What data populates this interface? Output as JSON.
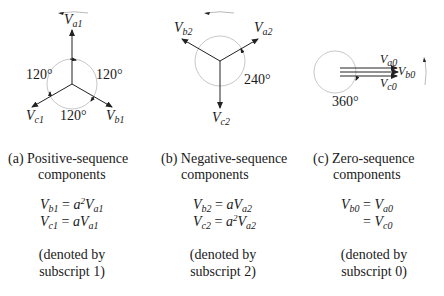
{
  "panels": [
    {
      "id": "a",
      "caption_line1": "(a) Positive-sequence",
      "caption_line2": "components",
      "phasors": [
        {
          "name": "V",
          "sub": "a1",
          "angle_deg": 90
        },
        {
          "name": "V",
          "sub": "b1",
          "angle_deg": -30
        },
        {
          "name": "V",
          "sub": "c1",
          "angle_deg": 210
        }
      ],
      "angle_labels": [
        "120°",
        "120°",
        "120°"
      ],
      "rotation": "counter-clockwise",
      "equations": [
        {
          "lhs": "V",
          "lhs_sub": "b1",
          "eq": "=",
          "coef": "a",
          "coef_sup": "2",
          "rhs": "V",
          "rhs_sub": "a1"
        },
        {
          "lhs": "V",
          "lhs_sub": "c1",
          "eq": "=",
          "coef": "a",
          "coef_sup": "",
          "rhs": "V",
          "rhs_sub": "a1"
        }
      ],
      "note_line1": "(denoted by",
      "note_line2": "subscript 1)"
    },
    {
      "id": "b",
      "caption_line1": "(b) Negative-sequence",
      "caption_line2": "components",
      "phasors": [
        {
          "name": "V",
          "sub": "a2",
          "angle_deg": 30
        },
        {
          "name": "V",
          "sub": "b2",
          "angle_deg": 150
        },
        {
          "name": "V",
          "sub": "c2",
          "angle_deg": 270
        }
      ],
      "angle_labels": [
        "240°"
      ],
      "rotation": "counter-clockwise",
      "equations": [
        {
          "lhs": "V",
          "lhs_sub": "b2",
          "eq": "=",
          "coef": "a",
          "coef_sup": "",
          "rhs": "V",
          "rhs_sub": "a2"
        },
        {
          "lhs": "V",
          "lhs_sub": "c2",
          "eq": "=",
          "coef": "a",
          "coef_sup": "2",
          "rhs": "V",
          "rhs_sub": "a2"
        }
      ],
      "note_line1": "(denoted by",
      "note_line2": "subscript 2)"
    },
    {
      "id": "c",
      "caption_line1": "(c) Zero-sequence",
      "caption_line2": "components",
      "phasors": [
        {
          "name": "V",
          "sub": "a0",
          "angle_deg": 0
        },
        {
          "name": "V",
          "sub": "b0",
          "angle_deg": 0
        },
        {
          "name": "V",
          "sub": "c0",
          "angle_deg": 0
        }
      ],
      "angle_labels": [
        "360°"
      ],
      "rotation": "counter-clockwise",
      "equations": [
        {
          "lhs": "V",
          "lhs_sub": "b0",
          "eq": "=",
          "coef": "",
          "coef_sup": "",
          "rhs": "V",
          "rhs_sub": "a0"
        },
        {
          "lhs": "",
          "lhs_sub": "",
          "eq": "=",
          "coef": "",
          "coef_sup": "",
          "rhs": "V",
          "rhs_sub": "c0"
        }
      ],
      "note_line1": "(denoted by",
      "note_line2": "subscript 0)"
    }
  ],
  "colors": {
    "line": "#222222",
    "circle": "#c8c8c8",
    "text": "#1a1a1a"
  }
}
